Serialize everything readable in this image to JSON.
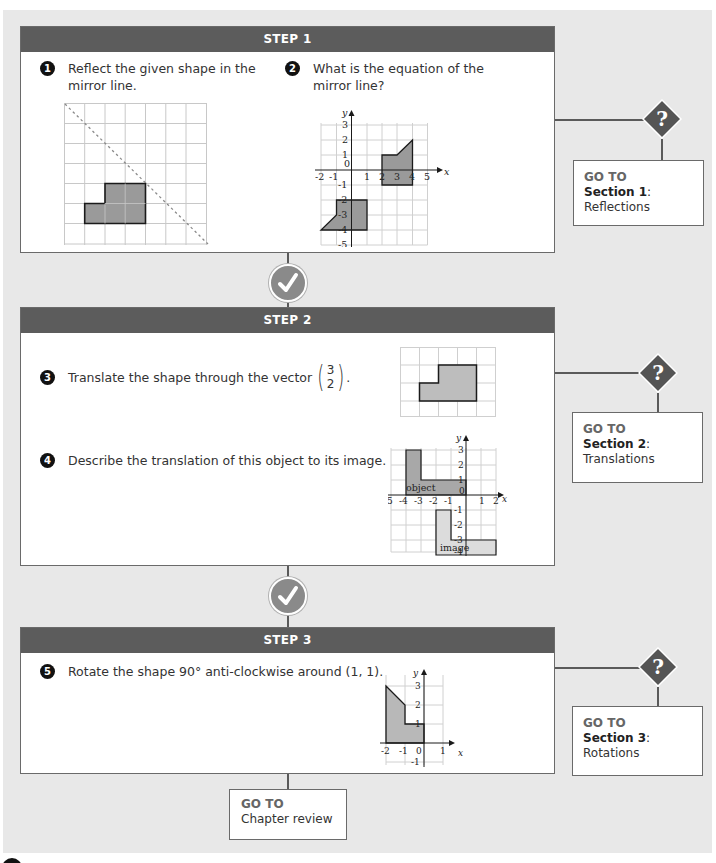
{
  "steps": [
    {
      "title": "STEP 1",
      "questions": [
        {
          "number": "1",
          "text": "Reflect the given shape in the mirror line."
        },
        {
          "number": "2",
          "text": "What is the equation of the mirror line?"
        }
      ],
      "goto": {
        "label": "GO TO",
        "section": "Section 1",
        "colon": ":",
        "name": "Reflections"
      }
    },
    {
      "title": "STEP 2",
      "questions": [
        {
          "number": "3",
          "text": "Translate the shape through the vector",
          "vector": [
            "3",
            "2"
          ],
          "suffix": "."
        },
        {
          "number": "4",
          "text": "Describe the translation of this object to its image."
        }
      ],
      "goto": {
        "label": "GO TO",
        "section": "Section 2",
        "colon": ":",
        "name": "Translations"
      }
    },
    {
      "title": "STEP 3",
      "questions": [
        {
          "number": "5",
          "text": "Rotate the shape 90° anti-clockwise around (1, 1)."
        }
      ],
      "goto": {
        "label": "GO TO",
        "section": "Section 3",
        "colon": ":",
        "name": "Rotations"
      }
    }
  ],
  "final_goto": {
    "label": "GO TO",
    "name": "Chapter review"
  },
  "icons": {
    "check": "check-mark-icon",
    "help": "question-diamond-icon"
  },
  "graphs": {
    "q2": {
      "x_label": "x",
      "y_label": "y",
      "x_ticks": [
        "-2",
        "-1",
        "0",
        "1",
        "2",
        "3",
        "4",
        "5"
      ],
      "y_ticks": [
        "3",
        "2",
        "1",
        "-1",
        "-2",
        "-3",
        "-4",
        "-5"
      ]
    },
    "q4": {
      "x_label": "x",
      "y_label": "y",
      "x_ticks": [
        "-5",
        "-4",
        "-3",
        "-2",
        "-1",
        "0",
        "1",
        "2"
      ],
      "y_ticks": [
        "3",
        "2",
        "1",
        "-1",
        "-2",
        "-3",
        "-4"
      ],
      "object_label": "object",
      "image_label": "image"
    },
    "q5": {
      "x_label": "x",
      "y_label": "y",
      "x_ticks": [
        "-2",
        "-1",
        "0",
        "1"
      ],
      "y_ticks": [
        "3",
        "2",
        "1",
        "-1"
      ]
    }
  },
  "colors": {
    "header": "#5c5c5c",
    "shape_fill": "#9a9a9a",
    "light_fill": "#d6d6d6",
    "page_bg": "#e8e8e8"
  }
}
